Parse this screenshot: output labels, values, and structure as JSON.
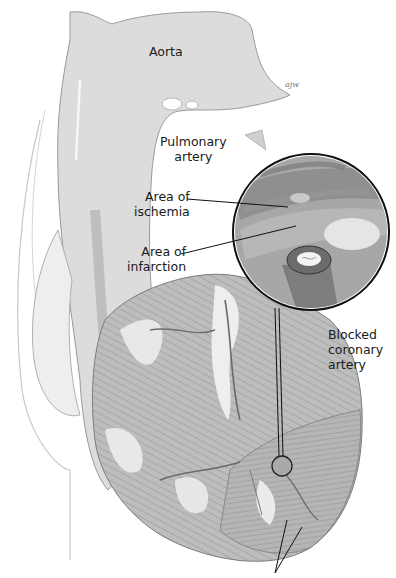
{
  "figure": {
    "signature": "ajw",
    "colors": {
      "background": "#ffffff",
      "tissue_light": "#e2e2e2",
      "tissue_mid": "#b9b9b9",
      "tissue_dark": "#8a8a8a",
      "outline": "#555555",
      "leader_line": "#111111",
      "label_text": "#1a1a1a"
    }
  },
  "labels": {
    "aorta": "Aorta",
    "pulmonary_artery": "Pulmonary\nartery",
    "area_of_ischemia": "Area of\nischemia",
    "area_of_infarction": "Area of\ninfarction",
    "blocked_coronary_artery": "Blocked\ncoronary\nartery"
  },
  "magnifier": {
    "center": [
      311,
      232
    ],
    "radius": 77,
    "source_circle": {
      "center": [
        282,
        466
      ],
      "radius": 11
    }
  }
}
